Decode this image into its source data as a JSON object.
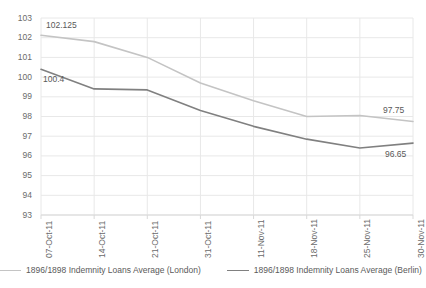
{
  "chart_data": {
    "type": "line",
    "title": "",
    "xlabel": "",
    "ylabel": "",
    "ylim": [
      93,
      103
    ],
    "yticks": [
      93,
      94,
      95,
      96,
      97,
      98,
      99,
      100,
      101,
      102,
      103
    ],
    "grid": true,
    "legend_position": "bottom",
    "categories": [
      "07-Oct-11",
      "14-Oct-11",
      "21-Oct-11",
      "31-Oct-11",
      "11-Nov-11",
      "18-Nov-11",
      "25-Nov-11",
      "30-Nov-11"
    ],
    "series": [
      {
        "name": "1896/1898 Indemnity Loans Average (London)",
        "color": "#c4c4c4",
        "values": [
          102.125,
          101.8,
          101.0,
          99.7,
          98.8,
          98.0,
          98.05,
          97.75
        ]
      },
      {
        "name": "1896/1898 Indemnity Loans Average (Berlin)",
        "color": "#808080",
        "values": [
          100.4,
          99.4,
          99.35,
          98.3,
          97.5,
          96.85,
          96.4,
          96.65
        ]
      }
    ],
    "annotations": [
      {
        "text": "102.125",
        "series": "1896/1898 Indemnity Loans Average (London)",
        "point_index": 0
      },
      {
        "text": "100.4",
        "series": "1896/1898 Indemnity Loans Average (Berlin)",
        "point_index": 0
      },
      {
        "text": "97.75",
        "series": "1896/1898 Indemnity Loans Average (London)",
        "point_index": 7
      },
      {
        "text": "96.65",
        "series": "1896/1898 Indemnity Loans Average (Berlin)",
        "point_index": 7
      }
    ]
  },
  "legend": {
    "items": [
      {
        "label": "1896/1898 Indemnity Loans Average (London)",
        "color": "#c4c4c4"
      },
      {
        "label": "1896/1898 Indemnity Loans Average (Berlin)",
        "color": "#808080"
      }
    ]
  },
  "colors": {
    "london_line": "#c4c4c4",
    "berlin_line": "#808080",
    "gridline": "#e8e8e8",
    "axis": "#d9d9d9",
    "text": "#6b6b6b",
    "background": "#ffffff"
  }
}
